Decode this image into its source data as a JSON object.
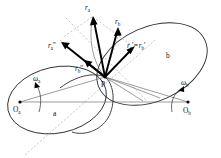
{
  "figure": {
    "type": "diagram",
    "background_color": "#ffffff",
    "ink_color": "#111111",
    "construction_color": "#9a9a9a",
    "bodies": [
      {
        "id": "a",
        "label": "a",
        "center_label": "O",
        "center_subscript": "a",
        "omega_label": "ω",
        "omega_subscript": "a"
      },
      {
        "id": "b",
        "label": "b",
        "center_label": "O",
        "center_subscript": "b",
        "omega_label": "ω",
        "omega_subscript": "b"
      }
    ],
    "contact_point": {
      "label": "P"
    },
    "vectors": [
      {
        "id": "r_a",
        "base": "r",
        "sub": "a",
        "primes": "",
        "label_text": "r"
      },
      {
        "id": "r_b",
        "base": "r",
        "sub": "b",
        "primes": "",
        "label_text": "r"
      },
      {
        "id": "r_a_dprime",
        "base": "r",
        "sub": "a",
        "primes": "''",
        "label_text": "r"
      },
      {
        "id": "r_b_dprime",
        "base": "r",
        "sub": "b",
        "primes": "''",
        "label_text": "r"
      },
      {
        "id": "r_prime_eq",
        "base": "r",
        "sub": "a",
        "primes": "'",
        "label_text": "r"
      }
    ],
    "labels": {
      "r_a": "r",
      "r_a_sub": "a",
      "r_b": "r",
      "r_b_sub": "b",
      "r_a_dprime": "r",
      "r_a_dprime_sub": "a",
      "r_a_dprime_marks": "''",
      "r_b_dprime": "r",
      "r_b_dprime_sub": "b",
      "r_b_dprime_marks": "''",
      "eq_lhs": "r",
      "eq_lhs_sub": "a",
      "eq_lhs_prime": "'",
      "eq_sign": "=",
      "eq_rhs": "r",
      "eq_rhs_sub": "b",
      "eq_rhs_prime": "'",
      "point_p": "P",
      "origin_a": "O",
      "origin_a_sub": "a",
      "origin_b": "O",
      "origin_b_sub": "b",
      "omega_a": "ω",
      "omega_a_sub": "a",
      "omega_b": "ω",
      "omega_b_sub": "b",
      "body_a": "a",
      "body_b": "b"
    }
  }
}
